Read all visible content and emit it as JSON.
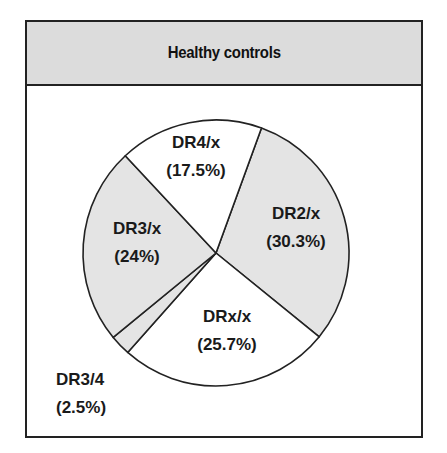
{
  "chart_data": {
    "type": "pie",
    "title": "Healthy controls",
    "categories": [
      "DR2/x",
      "DRx/x",
      "DR3/4",
      "DR3/x",
      "DR4/x"
    ],
    "values": [
      30.3,
      25.7,
      2.5,
      24,
      17.5
    ],
    "labels": [
      "DR2/x",
      "DRx/x",
      "DR3/4",
      "DR3/x",
      "DR4/x"
    ],
    "percent_labels": [
      "(30.3%)",
      "(25.7%)",
      "(2.5%)",
      "(24%)",
      "(17.5%)"
    ],
    "colors": [
      "#e4e4e4",
      "#ffffff",
      "#e4e4e4",
      "#e4e4e4",
      "#ffffff"
    ],
    "legend": "none (labels placed on/near slices)"
  },
  "header": {
    "title": "Healthy controls"
  },
  "slices": [
    {
      "name": "DR2/x",
      "pct": "(30.3%)"
    },
    {
      "name": "DRx/x",
      "pct": "(25.7%)"
    },
    {
      "name": "DR3/4",
      "pct": "(2.5%)"
    },
    {
      "name": "DR3/x",
      "pct": "(24%)"
    },
    {
      "name": "DR4/x",
      "pct": "(17.5%)"
    }
  ],
  "style": {
    "slice_fill_shaded": "#e4e4e4",
    "slice_fill_white": "#ffffff",
    "stroke": "#222222",
    "header_bg": "#dcdcdc"
  }
}
